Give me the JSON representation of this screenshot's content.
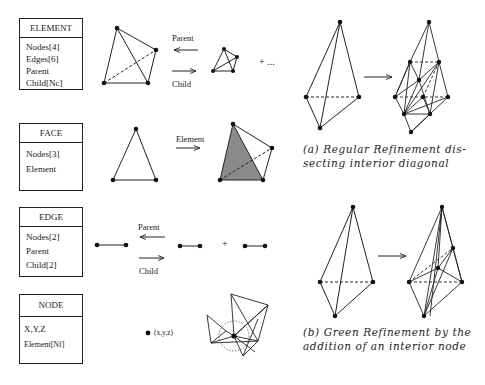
{
  "boxes": {
    "element": {
      "title": "ELEMENT",
      "fields": [
        "Nodes[4]",
        "Edges[6]",
        "Parent",
        "Child[Nc]"
      ]
    },
    "face": {
      "title": "FACE",
      "fields": [
        "Nodes[3]",
        "Element"
      ]
    },
    "edge": {
      "title": "EDGE",
      "fields": [
        "Nodes[2]",
        "Parent",
        "Child[2]"
      ]
    },
    "node": {
      "title": "NODE",
      "fields": [
        "X,Y,Z",
        "Element[Nf]"
      ]
    }
  },
  "labels": {
    "element_parent": "Parent",
    "element_child": "Child",
    "element_more": "+ ...",
    "face_element": "Element",
    "edge_parent": "Parent",
    "edge_child": "Child",
    "edge_plus": "+",
    "node_coord": "(x,y,z)"
  },
  "captions": {
    "a": "(a) Regular Refinement dissecting interior diagonal",
    "a_line1": "(a) Regular Refinement dis-",
    "a_line2": "secting interior diagonal",
    "b": "(b) Green Refinement by the addition of an interior node",
    "b_line1": "(b) Green Refinement by the",
    "b_line2": "addition of an interior node"
  },
  "colors": {
    "ink": "#1a1a1a",
    "shade": "#8a8a8a",
    "background": "#ffffff"
  }
}
